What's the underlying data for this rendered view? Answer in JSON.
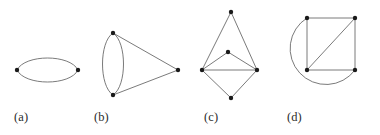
{
  "figure": {
    "type": "multigraph-diagram",
    "background_color": "#ffffff",
    "edge_color": "#6b6b6b",
    "vertex_color": "#1a1a1a",
    "caption_color": "#2b2b2b",
    "edge_width": 0.9,
    "vertex_radius": 2.2,
    "panels": [
      {
        "id": "a",
        "caption": "(a)",
        "description": "two vertices joined by two parallel edges forming a horizontal ellipse",
        "vertices": [
          {
            "name": "left",
            "x": 17,
            "y": 70
          },
          {
            "name": "right",
            "x": 78,
            "y": 70
          }
        ],
        "edges": [
          {
            "from": "left",
            "to": "right",
            "kind": "arc",
            "bulge": -14
          },
          {
            "from": "left",
            "to": "right",
            "kind": "arc",
            "bulge": 14
          }
        ]
      },
      {
        "id": "b",
        "caption": "(b)",
        "description": "two vertices joined by two parallel edges forming a vertical ellipse, plus a third vertex to the right joined to both",
        "vertices": [
          {
            "name": "top",
            "x": 113,
            "y": 33
          },
          {
            "name": "bottom",
            "x": 113,
            "y": 95
          },
          {
            "name": "apex",
            "x": 178,
            "y": 70
          }
        ],
        "edges": [
          {
            "from": "top",
            "to": "bottom",
            "kind": "arc",
            "bulge": -13
          },
          {
            "from": "top",
            "to": "bottom",
            "kind": "arc",
            "bulge": 13
          },
          {
            "from": "top",
            "to": "apex",
            "kind": "line"
          },
          {
            "from": "bottom",
            "to": "apex",
            "kind": "line"
          }
        ]
      },
      {
        "id": "c",
        "caption": "(c)",
        "description": "five vertices: top apex, inner middle vertex, left and right vertices joined horizontally, and a bottom apex",
        "vertices": [
          {
            "name": "top",
            "x": 231,
            "y": 12
          },
          {
            "name": "middle",
            "x": 228,
            "y": 52
          },
          {
            "name": "left",
            "x": 202,
            "y": 70
          },
          {
            "name": "right",
            "x": 257,
            "y": 70
          },
          {
            "name": "bottom",
            "x": 231,
            "y": 98
          }
        ],
        "edges": [
          {
            "from": "top",
            "to": "left",
            "kind": "line"
          },
          {
            "from": "top",
            "to": "right",
            "kind": "line"
          },
          {
            "from": "middle",
            "to": "left",
            "kind": "line"
          },
          {
            "from": "middle",
            "to": "right",
            "kind": "line"
          },
          {
            "from": "left",
            "to": "right",
            "kind": "line"
          },
          {
            "from": "left",
            "to": "bottom",
            "kind": "line"
          },
          {
            "from": "right",
            "to": "bottom",
            "kind": "line"
          }
        ]
      },
      {
        "id": "d",
        "caption": "(d)",
        "description": "a square with one diagonal, plus a large arc from the top-left vertex around to the bottom-right vertex",
        "vertices": [
          {
            "name": "top-left",
            "x": 307,
            "y": 18
          },
          {
            "name": "top-right",
            "x": 355,
            "y": 18
          },
          {
            "name": "bottom-left",
            "x": 307,
            "y": 70
          },
          {
            "name": "bottom-right",
            "x": 355,
            "y": 70
          }
        ],
        "edges": [
          {
            "from": "top-left",
            "to": "top-right",
            "kind": "line"
          },
          {
            "from": "top-right",
            "to": "bottom-right",
            "kind": "line"
          },
          {
            "from": "bottom-right",
            "to": "bottom-left",
            "kind": "line"
          },
          {
            "from": "bottom-left",
            "to": "top-left",
            "kind": "line"
          },
          {
            "from": "bottom-left",
            "to": "top-right",
            "kind": "line"
          },
          {
            "from": "top-left",
            "to": "bottom-right",
            "kind": "big-arc",
            "sweep": "counterclockwise",
            "radius": 36
          }
        ]
      }
    ]
  },
  "captions": {
    "a": "(a)",
    "b": "(b)",
    "c": "(c)",
    "d": "(d)"
  }
}
